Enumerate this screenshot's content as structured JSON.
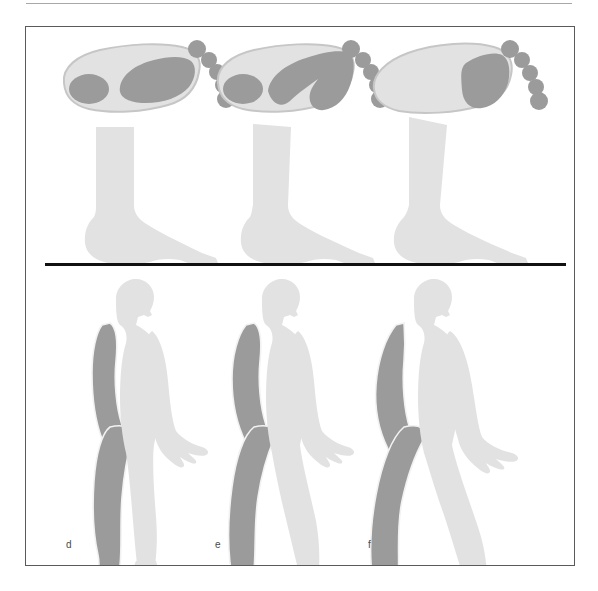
{
  "figure": {
    "caption_labels": [
      "d",
      "e",
      "f"
    ],
    "colors": {
      "light_gray": "#e2e2e2",
      "mid_gray": "#d2d2d2",
      "dark_gray": "#9b9b9b",
      "outline_gray": "#c6c6c6",
      "ground_line": "#111111",
      "frame_border": "#5a5a5a",
      "top_rule": "#a8a8a8",
      "label_text": "#4a4a4a",
      "background": "#ffffff"
    },
    "rows": [
      {
        "row_name": "plantar-pressure-footprints",
        "description": "Top row: three plantar pressure footprint maps viewed from below",
        "items": [
          {
            "id": "footprint-d",
            "loading_regions": [
              "heel",
              "midfoot-lateral",
              "metatarsal-arch"
            ],
            "toe_count": 5,
            "toes_loaded": false
          },
          {
            "id": "footprint-e",
            "loading_regions": [
              "heel",
              "metatarsal-arch",
              "forefoot-medial",
              "hallux"
            ],
            "toe_count": 5,
            "toes_loaded": false
          },
          {
            "id": "footprint-f",
            "loading_regions": [
              "forefoot-metatarsal-heads"
            ],
            "toe_count": 5,
            "toes_loaded": false
          }
        ]
      },
      {
        "row_name": "lateral-foot-views",
        "description": "Middle row: three lateral (side) views of the foot and ankle on the ground line",
        "items": [
          {
            "id": "foot-side-d",
            "heel_contact": true,
            "ankle_tilt_degrees": 0
          },
          {
            "id": "foot-side-e",
            "heel_contact": true,
            "ankle_tilt_degrees": 4
          },
          {
            "id": "foot-side-f",
            "heel_contact": true,
            "ankle_tilt_degrees": 8
          }
        ]
      },
      {
        "row_name": "gait-cycle-figures",
        "description": "Bottom row: three whole-body lateral silhouettes showing progressive gait phases",
        "items": [
          {
            "id": "walker-d",
            "label": "d",
            "stride_width_px": 52,
            "near_limb_shade": "light_gray",
            "far_limb_shade": "dark_gray"
          },
          {
            "id": "walker-e",
            "label": "e",
            "stride_width_px": 74,
            "near_limb_shade": "light_gray",
            "far_limb_shade": "dark_gray"
          },
          {
            "id": "walker-f",
            "label": "f",
            "stride_width_px": 98,
            "near_limb_shade": "light_gray",
            "far_limb_shade": "dark_gray"
          }
        ]
      }
    ]
  }
}
